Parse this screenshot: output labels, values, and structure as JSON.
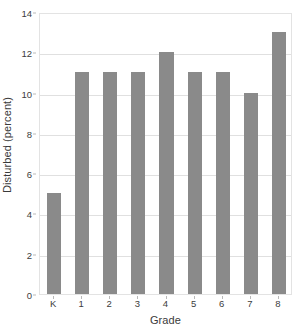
{
  "chart_data": {
    "type": "bar",
    "title": "",
    "xlabel": "Grade",
    "ylabel": "Disturbed (percent)",
    "categories": [
      "K",
      "1",
      "2",
      "3",
      "4",
      "5",
      "6",
      "7",
      "8"
    ],
    "values": [
      5,
      11,
      11,
      11,
      12,
      11,
      11,
      10,
      13
    ],
    "series": [
      {
        "name": "Disturbed (percent)",
        "values": [
          5,
          11,
          11,
          11,
          12,
          11,
          11,
          10,
          13
        ]
      }
    ],
    "ylim": [
      0,
      14
    ],
    "xlim": [
      0,
      9
    ],
    "ytick_labels": [
      "0",
      "2",
      "4",
      "6",
      "8",
      "10",
      "12",
      "14"
    ],
    "ytick_values": [
      0,
      2,
      4,
      6,
      8,
      10,
      12,
      14
    ],
    "ytick_step": 2,
    "grid": "horizontal",
    "legend": "none",
    "bar_color": "#8a8a8a",
    "gridline_color": "#e0e0e0",
    "frame_color": "#e3e3e3",
    "background_color": "#ffffff",
    "annotations": []
  },
  "figure": {
    "title_sliver": ""
  }
}
